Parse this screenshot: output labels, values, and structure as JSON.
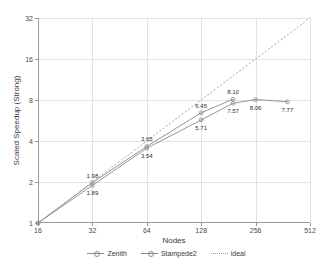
{
  "chart_data": {
    "type": "line",
    "title": "",
    "xlabel": "Nodes",
    "ylabel": "Scaled Speedup (Strong)",
    "xscale": "log2",
    "yscale": "log2",
    "xlim": [
      16,
      512
    ],
    "ylim": [
      1,
      32
    ],
    "xticks": [
      16,
      32,
      64,
      128,
      256,
      512
    ],
    "xtick_labels": [
      "16",
      "32",
      "64",
      "128",
      "256",
      "512"
    ],
    "yticks": [
      1,
      2,
      4,
      8,
      16,
      32
    ],
    "ytick_labels": [
      "1",
      "2",
      "4",
      "8",
      "16",
      "32"
    ],
    "grid": true,
    "legend_position": "bottom-center",
    "series": [
      {
        "name": "Zenith",
        "style": "solid",
        "color": "#8a8a8a",
        "marker": "circle-dot",
        "x": [
          16,
          32,
          64,
          128,
          192
        ],
        "values": [
          1.0,
          1.98,
          3.65,
          6.45,
          8.1
        ],
        "point_labels": [
          "",
          "1.98",
          "3.65",
          "6.45",
          "8.10"
        ]
      },
      {
        "name": "Stampede2",
        "style": "solid",
        "color": "#8a8a8a",
        "marker": "circle-dot",
        "x": [
          16,
          32,
          64,
          128,
          192,
          256,
          384
        ],
        "values": [
          1.0,
          1.89,
          3.54,
          5.71,
          7.57,
          8.06,
          7.77
        ],
        "point_labels": [
          "",
          "1.89",
          "3.54",
          "5.71",
          "7.57",
          "8.06",
          "7.77"
        ]
      },
      {
        "name": "ideal",
        "style": "dotted",
        "color": "#9a9a9a",
        "marker": "none",
        "x": [
          16,
          512
        ],
        "values": [
          1.0,
          32.0
        ],
        "point_labels": [
          "",
          ""
        ]
      }
    ]
  },
  "legend": {
    "entries": [
      {
        "label": "Zenith"
      },
      {
        "label": "Stampede2"
      },
      {
        "label": "ideal"
      }
    ]
  },
  "colors": {
    "series_line": "#8a8a8a",
    "ideal_line": "#9a9a9a",
    "grid": "#e2e2e2",
    "axis": "#9a9a9a",
    "text": "#3a3a3a"
  }
}
